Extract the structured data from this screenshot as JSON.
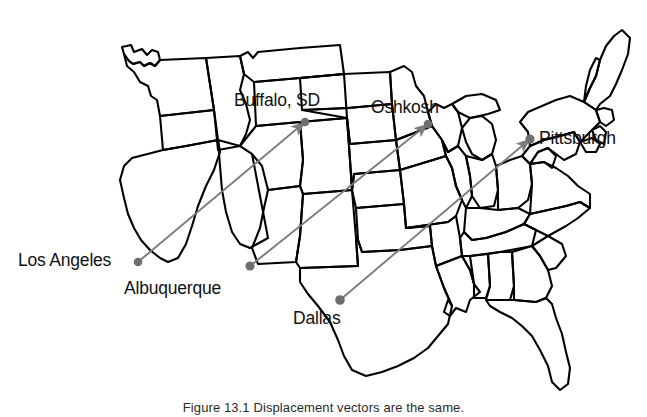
{
  "figure": {
    "kind": "map-diagram",
    "title_caption": "Figure 13.1  Displacement vectors are the same.",
    "caption_clipped": true,
    "background_color": "#ffffff",
    "outline_color": "#000000",
    "vector_color": "#7c7c7c",
    "marker_color": "#6e6e6e"
  },
  "cities": [
    {
      "name": "Los Angeles",
      "label": "Los Angeles",
      "marker_x": 138,
      "marker_y": 262,
      "label_x": 18,
      "label_y": 252,
      "role": "origin"
    },
    {
      "name": "Albuquerque",
      "label": "Albuquerque",
      "marker_x": 250,
      "marker_y": 266,
      "label_x": 124,
      "label_y": 280,
      "role": "origin"
    },
    {
      "name": "Dallas",
      "label": "Dallas",
      "marker_x": 340,
      "marker_y": 300,
      "label_x": 293,
      "label_y": 310,
      "role": "origin"
    },
    {
      "name": "Buffalo, SD",
      "label": "Buffalo, SD",
      "marker_x": 305,
      "marker_y": 122,
      "label_x": 234,
      "label_y": 92,
      "role": "destination"
    },
    {
      "name": "Oshkosh",
      "label": "Oshkosh",
      "marker_x": 428,
      "marker_y": 124,
      "label_x": 371,
      "label_y": 99,
      "role": "destination"
    },
    {
      "name": "Pittsburgh",
      "label": "Pittsburgh",
      "marker_x": 530,
      "marker_y": 139,
      "label_x": 539,
      "label_y": 130,
      "role": "destination"
    }
  ],
  "vectors": [
    {
      "name": "la-to-buffalo",
      "from": "Los Angeles",
      "to": "Buffalo, SD",
      "x1": 138,
      "y1": 262,
      "x2": 305,
      "y2": 122
    },
    {
      "name": "albuquerque-to-oshkosh",
      "from": "Albuquerque",
      "to": "Oshkosh",
      "x1": 250,
      "y1": 266,
      "x2": 428,
      "y2": 124
    },
    {
      "name": "dallas-to-pittsburgh",
      "from": "Dallas",
      "to": "Pittsburgh",
      "x1": 340,
      "y1": 300,
      "x2": 530,
      "y2": 139
    }
  ]
}
